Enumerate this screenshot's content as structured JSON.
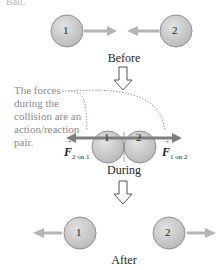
{
  "figure": {
    "top_fragment": "Ball.",
    "colors": {
      "ball_fill": "#c9c9c9",
      "ball_stroke": "#8f8f8f",
      "motion_arrow": "#b4b4b4",
      "force_arrow": "#7d7d7d",
      "stage_arrow_stroke": "#555555",
      "note_text": "#8a8a8a",
      "dotted_leader": "#9a9a9a"
    },
    "stages": {
      "before": {
        "label": "Before",
        "ball1": "1",
        "ball2": "2"
      },
      "during": {
        "label": "During",
        "ball1": "1",
        "ball2": "2"
      },
      "after": {
        "label": "After",
        "ball1": "1",
        "ball2": "2"
      }
    },
    "annotation": "The forces during the collision are an action/reaction pair.",
    "forces": {
      "left": {
        "symbol": "F",
        "subscript": "2 on 1"
      },
      "right": {
        "symbol": "F",
        "subscript": "1 on 2"
      }
    }
  }
}
